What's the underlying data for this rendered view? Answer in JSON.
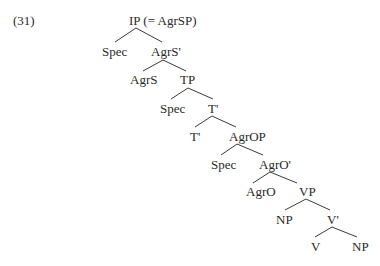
{
  "example_number": "(31)",
  "tree": {
    "nodes": [
      {
        "id": "ip",
        "label": "IP (= AgrSP)",
        "x": 129,
        "y": 14
      },
      {
        "id": "spec1",
        "label": "Spec",
        "x": 102,
        "y": 45
      },
      {
        "id": "agrs_bar",
        "label": "AgrS'",
        "x": 151,
        "y": 45
      },
      {
        "id": "agrs",
        "label": "AgrS",
        "x": 130,
        "y": 73
      },
      {
        "id": "tp",
        "label": "TP",
        "x": 180,
        "y": 73
      },
      {
        "id": "spec2",
        "label": "Spec",
        "x": 160,
        "y": 102
      },
      {
        "id": "t_bar",
        "label": "T'",
        "x": 208,
        "y": 102
      },
      {
        "id": "t",
        "label": "T'",
        "x": 190,
        "y": 130
      },
      {
        "id": "agrop",
        "label": "AgrOP",
        "x": 229,
        "y": 130
      },
      {
        "id": "spec3",
        "label": "Spec",
        "x": 211,
        "y": 158
      },
      {
        "id": "agro_bar",
        "label": "AgrO'",
        "x": 259,
        "y": 158
      },
      {
        "id": "agro",
        "label": "AgrO",
        "x": 246,
        "y": 185
      },
      {
        "id": "vp",
        "label": "VP",
        "x": 299,
        "y": 185
      },
      {
        "id": "np1",
        "label": "NP",
        "x": 276,
        "y": 213
      },
      {
        "id": "v_bar",
        "label": "V'",
        "x": 327,
        "y": 213
      },
      {
        "id": "v",
        "label": "V",
        "x": 311,
        "y": 240
      },
      {
        "id": "np2",
        "label": "NP",
        "x": 352,
        "y": 240
      }
    ],
    "edges": [
      {
        "from": "ip",
        "to": "spec1",
        "x1": 136,
        "y1": 28,
        "x2": 115,
        "y2": 42
      },
      {
        "from": "ip",
        "to": "agrs_bar",
        "x1": 136,
        "y1": 28,
        "x2": 162,
        "y2": 42
      },
      {
        "from": "agrs_bar",
        "to": "agrs",
        "x1": 163,
        "y1": 60,
        "x2": 143,
        "y2": 71
      },
      {
        "from": "agrs_bar",
        "to": "tp",
        "x1": 163,
        "y1": 60,
        "x2": 186,
        "y2": 71
      },
      {
        "from": "tp",
        "to": "spec2",
        "x1": 188,
        "y1": 88,
        "x2": 171,
        "y2": 99
      },
      {
        "from": "tp",
        "to": "t_bar",
        "x1": 188,
        "y1": 88,
        "x2": 213,
        "y2": 99
      },
      {
        "from": "t_bar",
        "to": "t",
        "x1": 212,
        "y1": 116,
        "x2": 195,
        "y2": 127
      },
      {
        "from": "t_bar",
        "to": "agrop",
        "x1": 212,
        "y1": 116,
        "x2": 236,
        "y2": 127
      },
      {
        "from": "agrop",
        "to": "spec3",
        "x1": 237,
        "y1": 144,
        "x2": 221,
        "y2": 155
      },
      {
        "from": "agrop",
        "to": "agro_bar",
        "x1": 237,
        "y1": 144,
        "x2": 263,
        "y2": 155
      },
      {
        "from": "agro_bar",
        "to": "agro",
        "x1": 270,
        "y1": 172,
        "x2": 253,
        "y2": 183
      },
      {
        "from": "agro_bar",
        "to": "vp",
        "x1": 270,
        "y1": 172,
        "x2": 297,
        "y2": 183
      },
      {
        "from": "vp",
        "to": "np1",
        "x1": 306,
        "y1": 199,
        "x2": 285,
        "y2": 210
      },
      {
        "from": "vp",
        "to": "v_bar",
        "x1": 306,
        "y1": 199,
        "x2": 330,
        "y2": 210
      },
      {
        "from": "v_bar",
        "to": "v",
        "x1": 332,
        "y1": 227,
        "x2": 315,
        "y2": 237
      },
      {
        "from": "v_bar",
        "to": "np2",
        "x1": 332,
        "y1": 227,
        "x2": 357,
        "y2": 237
      }
    ]
  }
}
